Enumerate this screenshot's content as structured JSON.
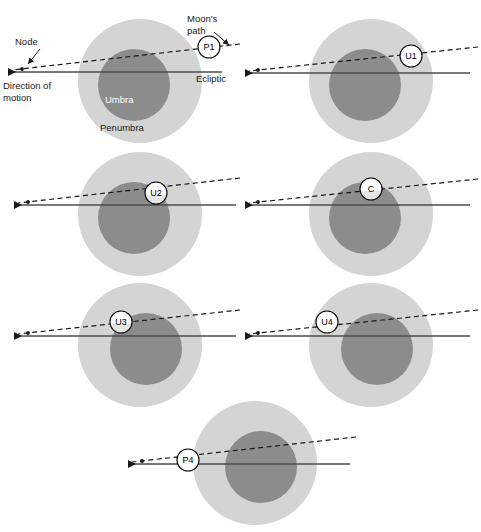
{
  "figure": {
    "background_color": "#ffffff"
  },
  "colors": {
    "penumbra": "#d4d4d4",
    "umbra": "#8c8c8c",
    "moon_fill": "#ffffff",
    "moon_stroke": "#000000",
    "ecliptic_line": "#4d4d4d",
    "moon_path_line": "#1a1a1a",
    "text": "#1a1a1a",
    "umbra_text": "#ffffff"
  },
  "annotations": {
    "node_label": "Node",
    "direction_line1": "Direction of",
    "direction_line2": "motion",
    "moons_path_line1": "Moon's",
    "moons_path_line2": "path",
    "ecliptic_label": "Ecliptic",
    "umbra_label": "Umbra",
    "penumbra_label": "Penumbra"
  },
  "geometry": {
    "penumbra_radius": 62,
    "umbra_radius": 36,
    "moon_radius": 11,
    "ecliptic_slope_note": "solid line, near horizontal",
    "moon_path_slope_note": "dashed line, rising to the right",
    "motion_direction": "right to left (westward on sky)"
  },
  "panels": [
    {
      "id": "p1",
      "contact_label": "P1",
      "contact_name": "first penumbral contact",
      "center_x": 140,
      "center_y": 81,
      "moon_x": 209,
      "moon_y": 47,
      "moon_shading": "full-white",
      "has_annotations": true
    },
    {
      "id": "u1",
      "contact_label": "U1",
      "contact_name": "first umbral contact",
      "center_x": 371,
      "center_y": 81,
      "moon_x": 411,
      "moon_y": 56,
      "moon_shading": "full-white",
      "has_annotations": false
    },
    {
      "id": "u2",
      "contact_label": "U2",
      "contact_name": "second umbral contact / totality begins",
      "center_x": 140,
      "center_y": 214,
      "moon_x": 156,
      "moon_y": 193,
      "moon_shading": "bottom-shaded",
      "has_annotations": false
    },
    {
      "id": "c",
      "contact_label": "C",
      "contact_name": "greatest eclipse",
      "center_x": 371,
      "center_y": 214,
      "moon_x": 371,
      "moon_y": 189,
      "moon_shading": "bottom-shaded",
      "has_annotations": false
    },
    {
      "id": "u3",
      "contact_label": "U3",
      "contact_name": "third umbral contact / totality ends",
      "center_x": 140,
      "center_y": 345,
      "moon_x": 121,
      "moon_y": 322,
      "moon_shading": "bottom-shaded",
      "has_annotations": false
    },
    {
      "id": "u4",
      "contact_label": "U4",
      "contact_name": "fourth umbral contact",
      "center_x": 371,
      "center_y": 345,
      "moon_x": 327,
      "moon_y": 322,
      "moon_shading": "full-white",
      "has_annotations": false
    },
    {
      "id": "p4",
      "contact_label": "P4",
      "contact_name": "last penumbral contact",
      "center_x": 255,
      "center_y": 463,
      "moon_x": 188,
      "moon_y": 460,
      "moon_shading": "full-white",
      "has_annotations": false
    }
  ]
}
